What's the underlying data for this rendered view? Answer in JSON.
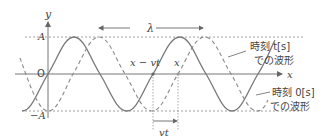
{
  "axes": {
    "y_label": "y",
    "x_label": "x",
    "origin_label": "O",
    "amplitude_pos_label": "A",
    "amplitude_neg_label": "−A"
  },
  "annotations": {
    "wavelength_label": "λ",
    "x_minus_vt_label": "x − vt",
    "x_label": "x",
    "vt_label": "vt"
  },
  "legend": {
    "dashed_line1": "時刻 t[s]",
    "dashed_line2": "での波形",
    "solid_line1": "時刻 0[s]",
    "solid_line2": "での波形"
  },
  "colors": {
    "stroke": "#777777",
    "text": "#444444"
  }
}
